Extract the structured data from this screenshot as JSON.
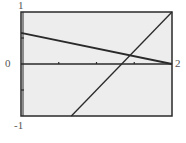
{
  "chart_data": {
    "type": "line",
    "title": "",
    "xlabel": "",
    "ylabel": "",
    "xlim": [
      0,
      2
    ],
    "ylim": [
      -1,
      1
    ],
    "grid": false,
    "legend": null,
    "x_ticks": [
      0.5,
      1,
      1.5
    ],
    "y_ticks": [
      0.5,
      -0.5
    ],
    "tick_labels": {
      "y_top": "1",
      "y_bottom": "-1",
      "x_left": "0",
      "x_right": "2"
    },
    "series": [
      {
        "name": "decreasing line",
        "x": [
          0,
          2
        ],
        "y": [
          0.6,
          0.0
        ],
        "equation": "y = 0.6 - 0.3x"
      },
      {
        "name": "increasing line",
        "x": [
          0.667,
          2
        ],
        "y": [
          -1,
          1
        ],
        "equation": "y = 1.5x - 2"
      }
    ],
    "intersection": {
      "x": 1.44,
      "y": 0.17
    }
  },
  "colors": {
    "plot_bg": "#ededed",
    "frame": "#2a2a2a",
    "line": "#2a2a2a",
    "label": "#555555"
  },
  "plot": {
    "left": 21,
    "top": 12,
    "right": 172,
    "bottom": 116
  }
}
